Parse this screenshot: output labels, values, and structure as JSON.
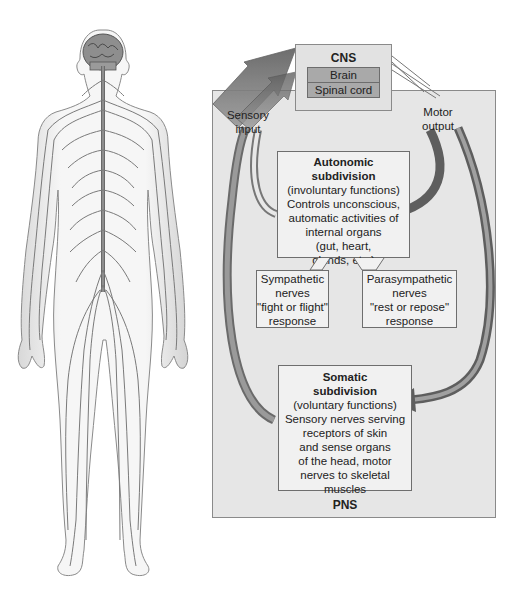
{
  "cns": {
    "title": "CNS",
    "parts": [
      "Brain",
      "Spinal cord"
    ]
  },
  "arrows": {
    "sensory_input": [
      "Sensory",
      "input"
    ],
    "motor_output": [
      "Motor",
      "output"
    ]
  },
  "autonomic": {
    "title": [
      "Autonomic",
      "subdivision"
    ],
    "body": [
      "(involuntary functions)",
      "Controls unconscious,",
      "automatic activities of",
      "internal organs",
      "(gut, heart,",
      "glands, etc.)"
    ]
  },
  "sympathetic": {
    "lines": [
      "Sympathetic",
      "nerves",
      "\"fight or flight\"",
      "response"
    ]
  },
  "parasympathetic": {
    "lines": [
      "Parasympathetic",
      "nerves",
      "\"rest or repose\"",
      "response"
    ]
  },
  "somatic": {
    "title": [
      "Somatic",
      "subdivision"
    ],
    "body": [
      "(voluntary functions)",
      "Sensory nerves serving",
      "receptors of skin",
      "and sense organs",
      "of the head, motor",
      "nerves to skeletal",
      "muscles"
    ]
  },
  "pns": {
    "title": "PNS"
  },
  "figure": {
    "icon": "human-nervous-system-illustration"
  },
  "colors": {
    "panel_bg": "#e6e6e6",
    "box_bg": "#f1f1f1",
    "cns_row_bg": "#a9a9a9",
    "arrow_dark": "#6f6f6f",
    "arrow_light": "#a8a8a8",
    "nerve": "#7a7a7a"
  }
}
